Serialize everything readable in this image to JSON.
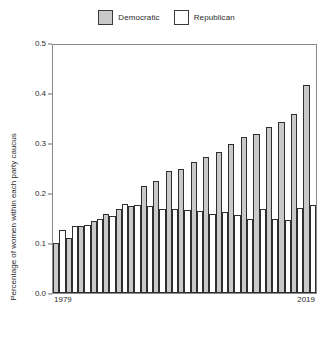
{
  "legend": {
    "entries": [
      {
        "label": "Democratic",
        "color": "#c9c9c9",
        "swatch": "filled-gray-square"
      },
      {
        "label": "Republican",
        "color": "#ffffff",
        "swatch": "white-square"
      }
    ]
  },
  "axes": {
    "y_label": "Percentage of women within each party caucus",
    "y_ticks": [
      "0.0",
      "0.1",
      "0.2",
      "0.3",
      "0.4",
      "0.5"
    ],
    "x_first": "1979",
    "x_last": "2019"
  },
  "chart_data": {
    "type": "bar",
    "title": "",
    "subtitle": "",
    "xlabel": "",
    "ylabel": "Percentage of women within each party caucus",
    "ylim": [
      0.0,
      0.5
    ],
    "yticks": [
      0.0,
      0.1,
      0.2,
      0.3,
      0.4,
      0.5
    ],
    "grid": false,
    "legend_position": "top-center",
    "categories": [
      "1979",
      "1981",
      "1983",
      "1985",
      "1987",
      "1989",
      "1991",
      "1993",
      "1995",
      "1997",
      "1999",
      "2001",
      "2003",
      "2005",
      "2007",
      "2009",
      "2011",
      "2013",
      "2015",
      "2017",
      "2019"
    ],
    "series": [
      {
        "name": "Democratic",
        "color": "#c9c9c9",
        "values": [
          0.1,
          0.11,
          0.135,
          0.145,
          0.16,
          0.17,
          0.175,
          0.215,
          0.225,
          0.245,
          0.25,
          0.265,
          0.275,
          0.285,
          0.3,
          0.315,
          0.32,
          0.335,
          0.345,
          0.36,
          0.42
        ]
      },
      {
        "name": "Republican",
        "color": "#ffffff",
        "values": [
          0.128,
          0.135,
          0.138,
          0.15,
          0.155,
          0.18,
          0.178,
          0.175,
          0.17,
          0.17,
          0.168,
          0.165,
          0.16,
          0.163,
          0.158,
          0.15,
          0.17,
          0.15,
          0.148,
          0.172,
          0.178
        ]
      }
    ]
  }
}
